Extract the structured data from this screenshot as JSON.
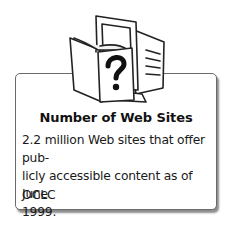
{
  "card": {
    "icon": "book-and-computer-question-icon",
    "title": "Number of Web Sites",
    "body_lines": [
      "2.2 million Web sites that offer pub-",
      "licly accessible content as of June",
      "1999."
    ],
    "source": "OCLC"
  },
  "colors": {
    "border": "#6a6a6a",
    "text": "#1a1a1a",
    "background": "#ffffff"
  }
}
